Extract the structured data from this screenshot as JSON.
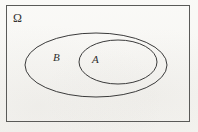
{
  "figure": {
    "kind": "venn-set-diagram",
    "caption": "",
    "background_color": "#f7f6f3",
    "stroke_color": "#3b3b3b"
  },
  "universe": {
    "label": "Ω",
    "name": "omega-universal-set",
    "shape": "rectangle",
    "x": 6,
    "y": 5,
    "width": 184,
    "height": 117,
    "border_color": "#5a5a58",
    "border_width": 1
  },
  "sets": [
    {
      "label": "B",
      "name": "set-b",
      "shape": "ellipse",
      "cx": 96,
      "cy": 65,
      "rx": 71,
      "ry": 32,
      "stroke": "#3b3b3b",
      "stroke_width": 1,
      "fill": "none",
      "label_x": 53,
      "label_y": 52
    },
    {
      "label": "A",
      "name": "set-a",
      "shape": "ellipse",
      "cx": 118,
      "cy": 62,
      "rx": 39,
      "ry": 22,
      "stroke": "#3b3b3b",
      "stroke_width": 1,
      "fill": "none",
      "label_x": 92,
      "label_y": 54
    }
  ],
  "relation": {
    "description": "A ⊂ B ⊂ Ω"
  }
}
